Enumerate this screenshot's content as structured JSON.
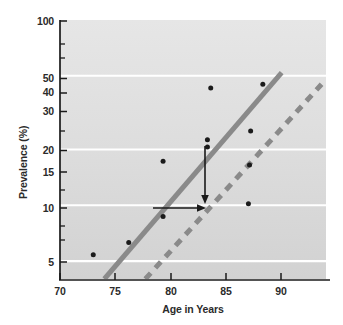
{
  "chart_data": {
    "type": "scatter",
    "title": "",
    "xlabel": "Age in Years",
    "ylabel": "Prevalence (%)",
    "xlim": [
      70,
      94
    ],
    "ylim": [
      4,
      100
    ],
    "yscale": "log",
    "xscale": "linear",
    "grid": true,
    "gridlines_y": [
      50,
      20,
      10,
      5
    ],
    "legend": "none",
    "xticks": [
      70,
      75,
      80,
      85,
      90
    ],
    "xtick_labels": [
      "70",
      "75",
      "80",
      "85",
      "90"
    ],
    "yticks": [
      100,
      50,
      40,
      30,
      20,
      15,
      10,
      5
    ],
    "ytick_labels": [
      "100",
      "50",
      "40",
      "30",
      "20",
      "15",
      "10",
      "5"
    ],
    "points": [
      {
        "x": 73.0,
        "y": 5.4
      },
      {
        "x": 76.2,
        "y": 6.3
      },
      {
        "x": 79.3,
        "y": 8.7
      },
      {
        "x": 79.3,
        "y": 17.3
      },
      {
        "x": 83.3,
        "y": 20.6
      },
      {
        "x": 83.3,
        "y": 22.6
      },
      {
        "x": 83.6,
        "y": 43.0
      },
      {
        "x": 87.0,
        "y": 10.2
      },
      {
        "x": 87.1,
        "y": 16.5
      },
      {
        "x": 87.2,
        "y": 25.2
      },
      {
        "x": 88.3,
        "y": 45.0
      }
    ],
    "lines": [
      {
        "name": "solid-trend-line",
        "style": "solid",
        "color": "#8a8a8a",
        "width": 5,
        "x_start": 74.0,
        "y_start": 4.0,
        "x_end": 90.0,
        "y_end": 52.0
      },
      {
        "name": "dashed-trend-line",
        "style": "dashed",
        "color": "#8a8a8a",
        "width": 5,
        "x_start": 77.7,
        "y_start": 4.0,
        "x_end": 93.6,
        "y_end": 45.0
      }
    ],
    "annotations": [
      {
        "name": "vertical-shift-arrow",
        "type": "arrow",
        "from": {
          "x": 84.0,
          "y": 20.0
        },
        "to": {
          "x": 84.0,
          "y": 10.3
        },
        "color": "#1a1a1a"
      },
      {
        "name": "horizontal-shift-arrow",
        "type": "arrow",
        "from": {
          "x": 79.5,
          "y": 10.0
        },
        "to": {
          "x": 84.0,
          "y": 10.0
        },
        "color": "#1a1a1a"
      }
    ],
    "plot_background": "#dcdcdc",
    "axis_color": "#1a1a1a",
    "point_color": "#1a1a1a",
    "gridline_color": "#ffffff"
  }
}
